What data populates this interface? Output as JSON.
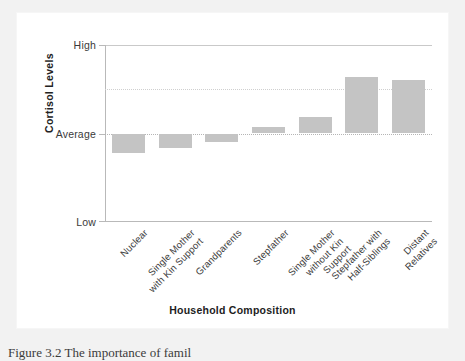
{
  "figure": {
    "caption": "Figure 3.2  The importance of famil"
  },
  "chart_data": {
    "type": "bar",
    "title": "",
    "xlabel": "Household Composition",
    "ylabel": "Cortisol Levels",
    "categories": [
      "Nuclear",
      "Single Mother\nwith Kin Support",
      "Grandparents",
      "Stepfather",
      "Single Mother\nwithout Kin\nSupport",
      "Stepfather with\nHalf-Siblings",
      "Distant\nRelatives"
    ],
    "values": [
      -0.215,
      -0.165,
      -0.095,
      0.075,
      0.185,
      0.635,
      0.605
    ],
    "ylim": [
      -1,
      1
    ],
    "ytick_labels": [
      "High",
      "Average",
      "Low"
    ],
    "ytick_values": [
      1,
      0,
      -1
    ],
    "gridlines": [
      0.5,
      0
    ],
    "grid": true,
    "legend": "none",
    "bar_color": "#c4c4c4",
    "baseline_label": "Average"
  }
}
